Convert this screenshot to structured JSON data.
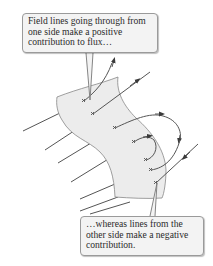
{
  "figure": {
    "surface_color": "#ececec",
    "line_color": "#555555"
  },
  "callouts": {
    "top": {
      "text": "Field lines going through from one side make a positive contribution to flux…"
    },
    "bottom": {
      "text": "…whereas lines from the other side make a negative contribution."
    }
  }
}
